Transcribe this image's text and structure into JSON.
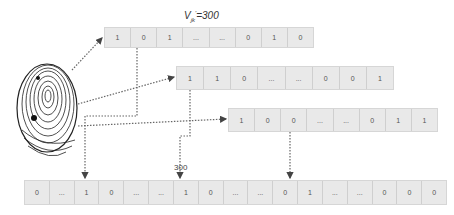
{
  "title": {
    "main": "V",
    "sub": "jk",
    "sup": "'",
    "rest": "=300"
  },
  "label_300": "300",
  "rows": {
    "top": [
      "1",
      "0",
      "1",
      "...",
      "...",
      "0",
      "1",
      "0"
    ],
    "second": [
      "1",
      "1",
      "0",
      "...",
      "...",
      "0",
      "0",
      "1"
    ],
    "third": [
      "1",
      "0",
      "0",
      "...",
      "...",
      "0",
      "1",
      "1"
    ],
    "bottom": [
      "0",
      "...",
      "1",
      "0",
      "...",
      "...",
      "1",
      "0",
      "...",
      "...",
      "0",
      "1",
      "...",
      "...",
      "0",
      "0",
      "0"
    ]
  },
  "colors": {
    "cell_bg": "#e9e9e9",
    "line": "#666666",
    "text": "#555555"
  },
  "icons": {
    "fingerprint": "fingerprint-icon"
  }
}
